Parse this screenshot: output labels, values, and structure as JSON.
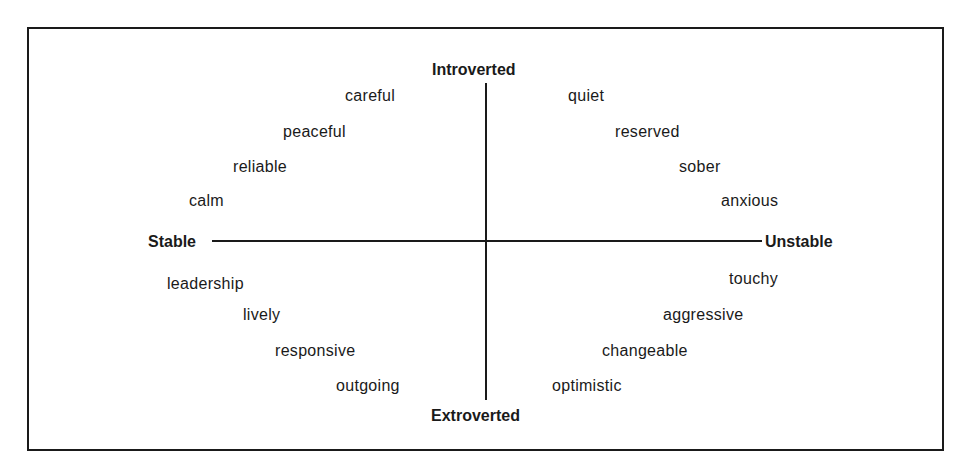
{
  "diagram": {
    "axes": {
      "top": "Introverted",
      "bottom": "Extroverted",
      "left": "Stable",
      "right": "Unstable"
    },
    "quadrants": {
      "introverted_stable": [
        "careful",
        "peaceful",
        "reliable",
        "calm"
      ],
      "introverted_unstable": [
        "quiet",
        "reserved",
        "sober",
        "anxious"
      ],
      "extroverted_stable": [
        "leadership",
        "lively",
        "responsive",
        "outgoing"
      ],
      "extroverted_unstable": [
        "touchy",
        "aggressive",
        "changeable",
        "optimistic"
      ]
    }
  }
}
